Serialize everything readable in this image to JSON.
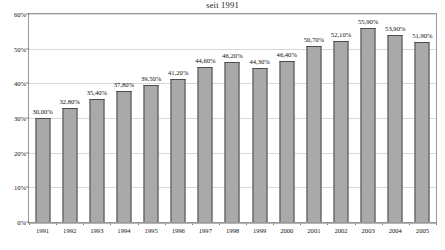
{
  "chart_data": {
    "type": "bar",
    "title": "seit 1991",
    "xlabel": "",
    "ylabel": "",
    "ylim": [
      0,
      60
    ],
    "grid": true,
    "legend": "none",
    "categories": [
      "1991",
      "1992",
      "1993",
      "1994",
      "1995",
      "1996",
      "1997",
      "1998",
      "1999",
      "2000",
      "2001",
      "2002",
      "2003",
      "2004",
      "2005"
    ],
    "values": [
      30.0,
      32.8,
      35.4,
      37.8,
      39.5,
      41.2,
      44.6,
      46.2,
      44.3,
      46.4,
      50.7,
      52.1,
      55.9,
      53.9,
      51.9
    ],
    "data_labels": [
      "30,00%",
      "32,80%",
      "35,40%",
      "37,80%",
      "39,50%",
      "41,20%",
      "44,60%",
      "46,20%",
      "44,30%",
      "46,40%",
      "50,70%",
      "52,10%",
      "55,90%",
      "53,90%",
      "51,90%"
    ],
    "ytick_values": [
      0,
      10,
      20,
      30,
      40,
      50,
      60
    ],
    "ytick_labels": [
      "0%",
      "10%",
      "20%",
      "30%",
      "40%",
      "50%",
      "60%"
    ],
    "colors": {
      "bar_fill": "#a9a9a9",
      "bar_border": "#4d4d4d",
      "gridline": "#d9d9d9",
      "frame": "#9a9a9a",
      "text": "#111111",
      "background": "#ffffff"
    }
  }
}
